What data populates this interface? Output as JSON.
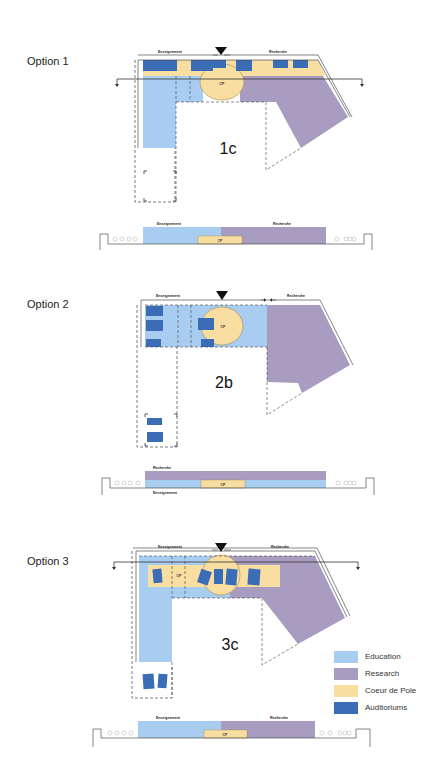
{
  "colors": {
    "education": "#a9cdf0",
    "research": "#a89cc0",
    "coeur": "#f8dea0",
    "auditorium": "#3a6db5",
    "line": "#333333"
  },
  "options": [
    {
      "label": "Option 1",
      "code": "1c",
      "plan_labels": {
        "left": "Enseignement",
        "right": "Recherche",
        "core": "CP"
      },
      "section_labels": {
        "left": "Enseignement",
        "right": "Recherche",
        "core": "CP"
      }
    },
    {
      "label": "Option 2",
      "code": "2b",
      "plan_labels": {
        "left": "Enseignement",
        "right": "Recherche",
        "core": "CP"
      },
      "section_labels": {
        "top": "Recherche",
        "bottom": "Enseignement",
        "core": "CP"
      }
    },
    {
      "label": "Option 3",
      "code": "3c",
      "plan_labels": {
        "left": "Enseignement",
        "right": "Recherche",
        "core": "CP"
      },
      "section_labels": {
        "left": "Enseignement",
        "right": "Recherche",
        "core": "CP"
      }
    }
  ],
  "legend": [
    {
      "label": "Education",
      "color": "#a9cdf0"
    },
    {
      "label": "Research",
      "color": "#a89cc0"
    },
    {
      "label": "Coeur de Pole",
      "color": "#f8dea0"
    },
    {
      "label": "Auditoriums",
      "color": "#3a6db5"
    }
  ]
}
